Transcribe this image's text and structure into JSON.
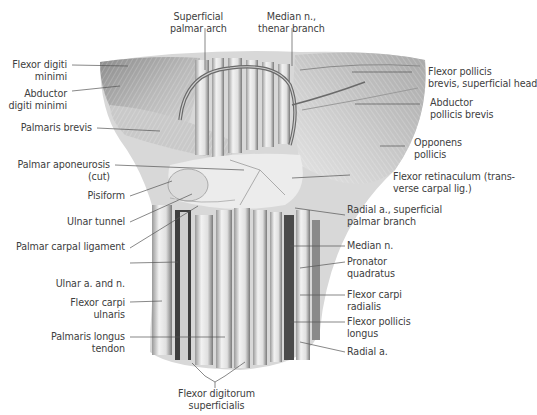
{
  "figure": {
    "colors": {
      "background": "#ffffff",
      "tissue_light": "#e8e8e8",
      "tissue_mid": "#b8b8b8",
      "tissue_dark": "#4a4a4a",
      "leader_line": "#555555",
      "label_text": "#404040"
    }
  },
  "labels": {
    "superficial_palmar_arch": {
      "line1": "Superficial",
      "line2": "palmar arch"
    },
    "median_n_thenar": {
      "line1": "Median n.,",
      "line2": "thenar branch"
    },
    "flexor_digiti_minimi": {
      "line1": "Flexor digiti",
      "line2": "minimi"
    },
    "abductor_digiti_minimi": {
      "line1": "Abductor",
      "line2": "digiti minimi"
    },
    "palmaris_brevis": {
      "line1": "Palmaris brevis"
    },
    "palmar_aponeurosis": {
      "line1": "Palmar aponeurosis",
      "line2": "(cut)"
    },
    "pisiform": {
      "line1": "Pisiform"
    },
    "ulnar_tunnel": {
      "line1": "Ulnar tunnel"
    },
    "palmar_carpal_ligament": {
      "line1": "Palmar carpal ligament"
    },
    "ulnar_a_n": {
      "line1": "Ulnar a. and n."
    },
    "flexor_carpi_ulnaris": {
      "line1": "Flexor carpi",
      "line2": "ulnaris"
    },
    "palmaris_longus": {
      "line1": "Palmaris longus",
      "line2": "tendon"
    },
    "flexor_digitorum_superficialis": {
      "line1": "Flexor digitorum",
      "line2": "superficialis"
    },
    "flexor_pollicis_brevis": {
      "line1": "Flexor pollicis",
      "line2": "brevis, superficial head"
    },
    "abductor_pollicis_brevis": {
      "line1": "Abductor",
      "line2": "pollicis brevis"
    },
    "opponens_pollicis": {
      "line1": "Opponens",
      "line2": "pollicis"
    },
    "flexor_retinaculum": {
      "line1": "Flexor retinaculum (trans-",
      "line2": "verse carpal lig.)"
    },
    "radial_a_superficial": {
      "line1": "Radial a., superficial",
      "line2": "palmar branch"
    },
    "median_n": {
      "line1": "Median n."
    },
    "pronator_quadratus": {
      "line1": "Pronator",
      "line2": "quadratus"
    },
    "flexor_carpi_radialis": {
      "line1": "Flexor carpi",
      "line2": "radialis"
    },
    "flexor_pollicis_longus": {
      "line1": "Flexor pollicis",
      "line2": "longus"
    },
    "radial_a": {
      "line1": "Radial a."
    }
  }
}
